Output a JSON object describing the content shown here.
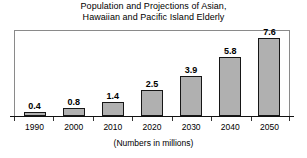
{
  "chart_data": {
    "type": "bar",
    "title": "Population and Projections of Asian, Hawaiian and Pacific Island Elderly",
    "title_lines": [
      "Population and Projections of Asian,",
      "Hawaiian and Pacific Island Elderly"
    ],
    "subtitle": "",
    "xlabel": "(Numbers in millions)",
    "ylabel": "",
    "categories": [
      "1990",
      "2000",
      "2010",
      "2020",
      "2030",
      "2040",
      "2050"
    ],
    "values": [
      0.4,
      0.8,
      1.4,
      2.5,
      3.9,
      5.8,
      7.6
    ],
    "value_labels": [
      "0.4",
      "0.8",
      "1.4",
      "2.5",
      "3.9",
      "5.8",
      "7.6"
    ],
    "ylim": [
      0,
      8.3
    ],
    "xlim_labels": [
      "1990",
      "2050"
    ],
    "grid": false,
    "legend": false,
    "legend_position": "none",
    "bar_fill_color": "#b0b0b0",
    "bar_edge_color": "#161616",
    "axis_color": "#111111",
    "frame_color": "#8a8a8a",
    "background_color": "#ffffff",
    "text_color": "#000000",
    "value_labels_position": "above-bar",
    "tick_position": "between-categories"
  }
}
